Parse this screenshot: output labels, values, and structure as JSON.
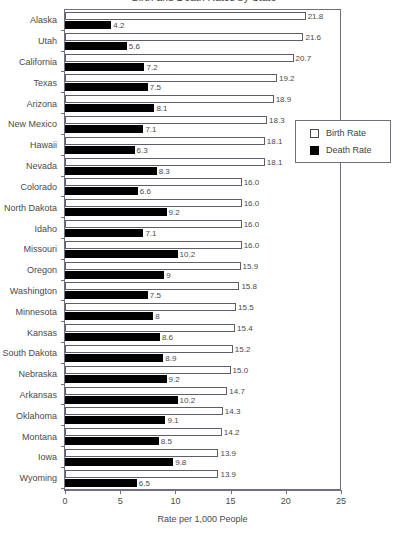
{
  "chart": {
    "title": "Birth and Death Rates by State",
    "xaxis_title": "Rate per 1,000 People",
    "xticks": [
      "0",
      "5",
      "10",
      "15",
      "20",
      "25"
    ]
  },
  "legend": {
    "entries": [
      {
        "label": "Birth Rate",
        "swatch": "white-square",
        "color": "#ffffff"
      },
      {
        "label": "Death Rate",
        "swatch": "black-square",
        "color": "#000000"
      }
    ]
  },
  "chart_data": {
    "type": "bar",
    "orientation": "horizontal",
    "title": "Birth and Death Rates by State",
    "xlabel": "Rate per 1,000 People",
    "ylabel": "",
    "xlim": [
      0,
      25
    ],
    "xticks": [
      0,
      5,
      10,
      15,
      20,
      25
    ],
    "grid": false,
    "legend_position": "right",
    "categories": [
      "Alaska",
      "Utah",
      "California",
      "Texas",
      "Arizona",
      "New Mexico",
      "Hawaii",
      "Nevada",
      "Colorado",
      "North Dakota",
      "Idaho",
      "Missouri",
      "Oregon",
      "Washington",
      "Minnesota",
      "Kansas",
      "South Dakota",
      "Nebraska",
      "Arkansas",
      "Oklahoma",
      "Montana",
      "Iowa",
      "Wyoming"
    ],
    "series": [
      {
        "name": "Birth Rate",
        "color": "#ffffff",
        "values": [
          21.8,
          21.6,
          20.7,
          19.2,
          18.9,
          18.3,
          18.1,
          18.1,
          16.0,
          16.0,
          16.0,
          16.0,
          15.9,
          15.8,
          15.5,
          15.4,
          15.2,
          15.0,
          14.7,
          14.3,
          14.2,
          13.9,
          13.9
        ],
        "labels": [
          "21.8",
          "21.6",
          "20.7",
          "19.2",
          "18.9",
          "18.3",
          "18.1",
          "18.1",
          "16.0",
          "16.0",
          "16.0",
          "16.0",
          "15.9",
          "15.8",
          "15.5",
          "15.4",
          "15.2",
          "15.0",
          "14.7",
          "14.3",
          "14.2",
          "13.9",
          "13.9"
        ]
      },
      {
        "name": "Death Rate",
        "color": "#000000",
        "values": [
          4.2,
          5.6,
          7.2,
          7.5,
          8.1,
          7.1,
          6.3,
          8.3,
          6.6,
          9.2,
          7.1,
          10.2,
          9.0,
          7.5,
          8.0,
          8.6,
          8.9,
          9.2,
          10.2,
          9.1,
          8.5,
          9.8,
          6.5
        ],
        "labels": [
          "4.2",
          "5.6",
          "7.2",
          "7.5",
          "8.1",
          "7.1",
          "6.3",
          "8.3",
          "6.6",
          "9.2",
          "7.1",
          "10.2",
          "9",
          "7.5",
          "8",
          "8.6",
          "8.9",
          "9.2",
          "10.2",
          "9.1",
          "8.5",
          "9.8",
          "6.5"
        ]
      }
    ]
  }
}
